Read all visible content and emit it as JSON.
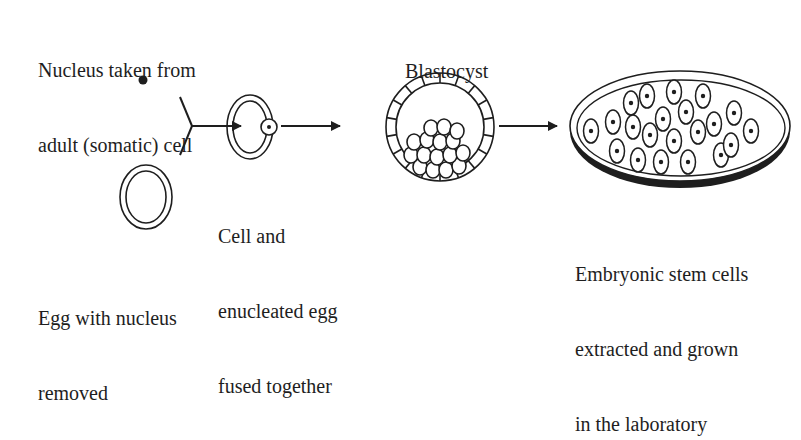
{
  "diagram": {
    "labels": {
      "nucleus": [
        "Nucleus taken from",
        "adult (somatic) cell"
      ],
      "egg": [
        "Egg with nucleus",
        "removed"
      ],
      "fused": [
        "Cell and",
        "enucleated egg",
        "fused together"
      ],
      "blastocyst": [
        "Blastocyst"
      ],
      "stem_cells": [
        "Embryonic stem cells",
        "extracted and grown",
        "in the laboratory"
      ]
    },
    "stages": [
      {
        "id": "nucleus",
        "name": "Nucleus taken from adult (somatic) cell",
        "shape": "filled-dot"
      },
      {
        "id": "egg",
        "name": "Egg with nucleus removed",
        "shape": "double-ring-oval"
      },
      {
        "id": "fused",
        "name": "Cell and enucleated egg fused together",
        "shape": "double-ring-oval-with-nucleus"
      },
      {
        "id": "blastocyst",
        "name": "Blastocyst",
        "shape": "segmented-ring-with-inner-cell-mass"
      },
      {
        "id": "stem_cells",
        "name": "Embryonic stem cells extracted and grown in the laboratory",
        "shape": "petri-dish-with-cells"
      }
    ],
    "edges": [
      {
        "from": "nucleus",
        "to": "fused",
        "type": "merge"
      },
      {
        "from": "egg",
        "to": "fused",
        "type": "merge"
      },
      {
        "from": "fused",
        "to": "blastocyst",
        "type": "arrow"
      },
      {
        "from": "blastocyst",
        "to": "stem_cells",
        "type": "arrow"
      }
    ],
    "colors": {
      "stroke": "#1e1e1e",
      "background": "#ffffff"
    }
  }
}
